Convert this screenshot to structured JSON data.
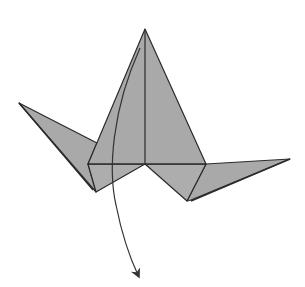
{
  "diagram": {
    "background": "#ffffff",
    "paper_fill": "#a9a9a9",
    "paper_fill_light": "#b3b3b3",
    "line_color": "#2b2b2b",
    "arrow_color": "#333333",
    "parts": [
      "left-wing",
      "right-wing",
      "body-flap",
      "center-crease",
      "fold-arrow"
    ]
  }
}
